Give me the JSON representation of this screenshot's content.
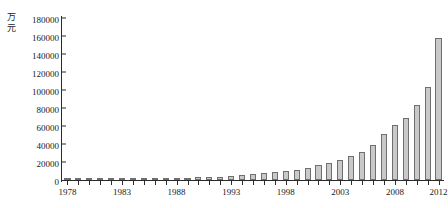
{
  "chart_data": {
    "type": "bar",
    "title": "",
    "xlabel": "年份",
    "ylabel": "万元",
    "y_unit_chars": [
      "万",
      "元"
    ],
    "x_unit_text": "( 年份 )",
    "ylim": [
      0,
      180000
    ],
    "ytick_step": 20000,
    "yticks": [
      0,
      20000,
      40000,
      60000,
      80000,
      100000,
      120000,
      140000,
      160000,
      180000
    ],
    "ytick_labels": [
      "0",
      "20000",
      "40000",
      "60000",
      "80000",
      "100000",
      "120000",
      "140000",
      "160000",
      "180000"
    ],
    "xtick_labels": [
      "1978",
      "1983",
      "1988",
      "1993",
      "1998",
      "2003",
      "2008",
      "2012"
    ],
    "grid": false,
    "legend": null,
    "bar_fill": "#c9c9c9",
    "bar_stroke": "#6f6f6f",
    "axis_color": "#2b2b2b",
    "categories": [
      "1978",
      "1979",
      "1980",
      "1981",
      "1982",
      "1983",
      "1984",
      "1985",
      "1986",
      "1987",
      "1988",
      "1989",
      "1990",
      "1991",
      "1992",
      "1993",
      "1994",
      "1995",
      "1996",
      "1997",
      "1998",
      "1999",
      "2000",
      "2001",
      "2002",
      "2003",
      "2004",
      "2005",
      "2006",
      "2007",
      "2008",
      "2009",
      "2010",
      "2011",
      "2012"
    ],
    "values": [
      1132,
      1146,
      1160,
      1176,
      1212,
      1367,
      1643,
      2005,
      2122,
      2199,
      2357,
      2665,
      2937,
      3149,
      3483,
      4349,
      5218,
      6242,
      7408,
      8651,
      9876,
      11444,
      13395,
      16386,
      18904,
      21715,
      26396,
      31649,
      38760,
      51322,
      61330,
      68518,
      83102,
      103874,
      158000
    ],
    "annotations": []
  }
}
